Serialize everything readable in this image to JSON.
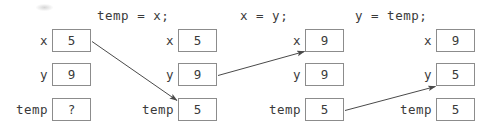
{
  "diagram": {
    "row_labels": [
      "x",
      "y",
      "temp"
    ],
    "steps": [
      {
        "title": "",
        "label_x": "x",
        "label_y": "y",
        "label_temp": "temp",
        "values": [
          "5",
          "9",
          "?"
        ]
      },
      {
        "title": "temp = x;",
        "label_x": "x",
        "label_y": "y",
        "label_temp": "temp",
        "values": [
          "5",
          "9",
          "5"
        ]
      },
      {
        "title": "x = y;",
        "label_x": "x",
        "label_y": "y",
        "label_temp": "temp",
        "values": [
          "9",
          "9",
          "5"
        ]
      },
      {
        "title": "y = temp;",
        "label_x": "x",
        "label_y": "y",
        "label_temp": "temp",
        "values": [
          "9",
          "5",
          "5"
        ]
      }
    ],
    "arrows": [
      {
        "name": "arrow-x-to-temp",
        "from": "step1-x",
        "to": "step2-temp"
      },
      {
        "name": "arrow-y-to-x",
        "from": "step2-y",
        "to": "step3-x"
      },
      {
        "name": "arrow-temp-to-y",
        "from": "step3-temp",
        "to": "step4-y"
      }
    ],
    "colors": {
      "ink": "#3a3a3a",
      "box_border": "#8c8c8c",
      "arrow": "#4a4a4a",
      "background": "#ffffff"
    }
  }
}
